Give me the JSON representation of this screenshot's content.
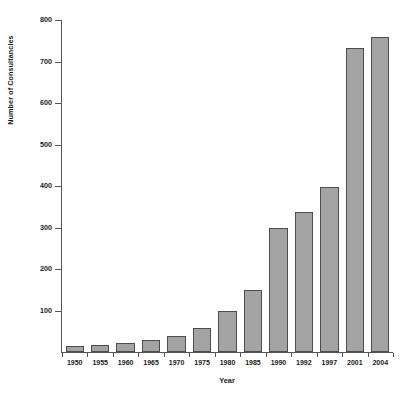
{
  "chart_data": {
    "type": "bar",
    "title": "",
    "xlabel": "Year",
    "ylabel": "Number of Consultancies",
    "categories": [
      "1950",
      "1955",
      "1960",
      "1965",
      "1970",
      "1975",
      "1980",
      "1985",
      "1990",
      "1992",
      "1997",
      "2001",
      "2004"
    ],
    "values": [
      15,
      17,
      22,
      28,
      38,
      58,
      100,
      150,
      300,
      337,
      397,
      733,
      760
    ],
    "ylim": [
      0,
      800
    ],
    "yticks": [
      100,
      200,
      300,
      400,
      500,
      600,
      700,
      800
    ],
    "ytick_labels": [
      "100",
      "200",
      "300",
      "400",
      "500",
      "600",
      "700",
      "800"
    ],
    "grid": false,
    "legend": null,
    "bar_fill_color": "#a3a3a3",
    "bar_edge_color": "#4d4d4d",
    "axis_color": "#555555"
  }
}
